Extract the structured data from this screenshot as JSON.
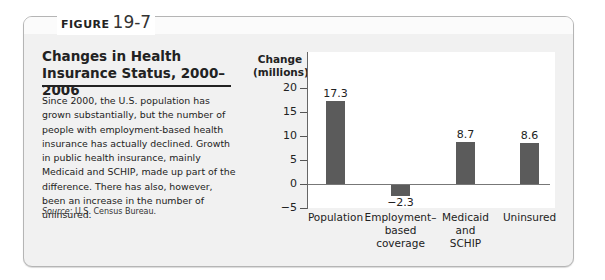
{
  "figure": {
    "label_word": "FIGURE",
    "label_number": "19-7",
    "title": "Changes in Health Insurance Status, 2000–2006",
    "caption": "Since 2000, the U.S. population has grown substantially, but the number of people with employment-based health insurance has actually declined. Growth in public health insurance, mainly Medicaid and SCHIP, made up part of the difference. There has also, however, been an increase in the number of uninsured.",
    "source_label": "Source:",
    "source_text": " U.S. Census Bureau."
  },
  "colors": {
    "bar": "#5b5b5b",
    "panel_bg": "#f1f1f1",
    "plot_bg": "#ffffff"
  },
  "chart_data": {
    "type": "bar",
    "title": "Changes in Health Insurance Status, 2000–2006",
    "xlabel": "",
    "ylabel": "Change (millions)",
    "ylabel_lines": [
      "Change",
      "(millions)"
    ],
    "categories": [
      "Population",
      "Employment-based coverage",
      "Medicaid and SCHIP",
      "Uninsured"
    ],
    "category_labels_display": [
      "Population",
      "Employment–\nbased\ncoverage",
      "Medicaid\nand\nSCHIP",
      "Uninsured"
    ],
    "values": [
      17.3,
      -2.3,
      8.7,
      8.6
    ],
    "value_labels": [
      "17.3",
      "−2.3",
      "8.7",
      "8.6"
    ],
    "ylim": [
      -5,
      20
    ],
    "yticks": [
      20,
      15,
      10,
      5,
      0,
      -5
    ],
    "ytick_labels": [
      "20",
      "15",
      "10",
      "5",
      "0",
      "−5"
    ],
    "grid": false,
    "legend": null,
    "source": "U.S. Census Bureau"
  }
}
